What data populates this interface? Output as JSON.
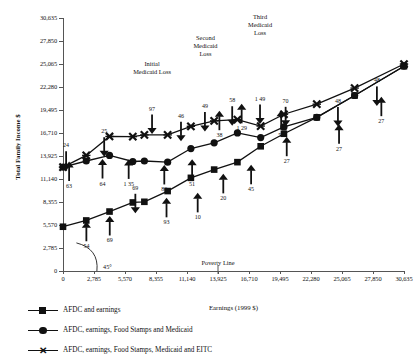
{
  "chart_data": {
    "type": "line",
    "title": "",
    "xlabel": "Earnings (1999 $)",
    "ylabel": "Total Family Income $",
    "xlim": [
      0,
      30635
    ],
    "ylim": [
      0,
      30635
    ],
    "grid": false,
    "legend_position": "below-plot",
    "xticks": [
      "0",
      "2,785",
      "5,570",
      "8,355",
      "11,140",
      "13,925",
      "16,710",
      "19,495",
      "22,280",
      "25,065",
      "27,850",
      "30,635"
    ],
    "yticks": [
      "0",
      "2,785",
      "5,570",
      "8,355",
      "11,140",
      "13,925",
      "16,710",
      "19,495",
      "22,280",
      "25,065",
      "27,850",
      "30,635"
    ],
    "xtick_values": [
      0,
      2785,
      5570,
      8355,
      11140,
      13925,
      16710,
      19495,
      22280,
      25065,
      27850,
      30635
    ],
    "ytick_values": [
      0,
      2785,
      5570,
      8355,
      11140,
      13925,
      16710,
      19495,
      22280,
      25065,
      27850,
      30635
    ],
    "series": [
      {
        "name": "AFDC and earnings",
        "marker": "square",
        "x": [
          0,
          2090,
          4180,
          6270,
          7310,
          9400,
          11490,
          13580,
          15670,
          17760,
          19850,
          22800,
          26200,
          30635
        ],
        "values": [
          5360,
          6120,
          7200,
          8300,
          8380,
          9680,
          11280,
          12280,
          13180,
          15100,
          16620,
          18600,
          21250,
          24800
        ]
      },
      {
        "name": "AFDC, earnings, Food Stamps and Medicaid",
        "marker": "circle",
        "x": [
          0,
          2090,
          4180,
          6270,
          7310,
          9400,
          11490,
          13580,
          15670,
          17760,
          19850,
          22800,
          26200,
          30635
        ],
        "values": [
          12580,
          13320,
          13990,
          13260,
          13320,
          13180,
          14830,
          15520,
          16720,
          16150,
          17450,
          18600,
          21250,
          24800
        ]
      },
      {
        "name": "AFDC, earnings, Food Stamps, Medicaid and EITC",
        "marker": "x",
        "x": [
          0,
          2090,
          4180,
          6270,
          7310,
          9400,
          11490,
          13580,
          15670,
          17760,
          19850,
          22800,
          26200,
          30635
        ],
        "values": [
          12580,
          14000,
          16290,
          16270,
          16480,
          16480,
          17520,
          18180,
          18340,
          17550,
          18980,
          20200,
          22150,
          25060
        ]
      }
    ],
    "annotations": [
      {
        "text": "24",
        "arrow": "down",
        "x": 280,
        "y": 14500
      },
      {
        "text": "25",
        "arrow": "down",
        "x": 3700,
        "y": 16200
      },
      {
        "text": "97",
        "arrow": "down",
        "x": 8000,
        "y": 18950
      },
      {
        "text": "46",
        "arrow": "down",
        "x": 10600,
        "y": 18080
      },
      {
        "text": "49",
        "arrow": "down",
        "x": 12750,
        "y": 19250
      },
      {
        "text": "58",
        "arrow": "down",
        "x": 15200,
        "y": 19950
      },
      {
        "text": "1 49",
        "arrow": "down",
        "x": 17700,
        "y": 20150
      },
      {
        "text": "70",
        "arrow": "down",
        "x": 20000,
        "y": 19880
      },
      {
        "text": "48",
        "arrow": "down",
        "x": 24700,
        "y": 19850
      },
      {
        "text": "48",
        "arrow": "down",
        "x": 28200,
        "y": 22350
      },
      {
        "text": "63",
        "arrow": "up",
        "x": 550,
        "y": 10900
      },
      {
        "text": "64",
        "arrow": "up",
        "x": 3550,
        "y": 11200
      },
      {
        "text": "1 35",
        "arrow": "up",
        "x": 5900,
        "y": 11150
      },
      {
        "text": "86",
        "arrow": "up",
        "x": 9100,
        "y": 10480
      },
      {
        "text": "51",
        "arrow": "up",
        "x": 11600,
        "y": 11180
      },
      {
        "text": "38",
        "arrow": "up",
        "x": 14050,
        "y": 17050
      },
      {
        "text": "1 29",
        "arrow": "up",
        "x": 16050,
        "y": 17880
      },
      {
        "text": "50",
        "arrow": "up",
        "x": 19600,
        "y": 17100
      },
      {
        "text": "27",
        "arrow": "up",
        "x": 20100,
        "y": 13900
      },
      {
        "text": "27",
        "arrow": "up",
        "x": 24800,
        "y": 15400
      },
      {
        "text": "27",
        "arrow": "up",
        "x": 28600,
        "y": 18750
      },
      {
        "text": "54",
        "arrow": "up",
        "x": 2100,
        "y": 3600
      },
      {
        "text": "69",
        "arrow": "up",
        "x": 4200,
        "y": 4300
      },
      {
        "text": "69",
        "arrow": "down",
        "x": 6500,
        "y": 9350
      },
      {
        "text": "93",
        "arrow": "up",
        "x": 9300,
        "y": 6500
      },
      {
        "text": "10",
        "arrow": "up",
        "x": 12100,
        "y": 7100
      },
      {
        "text": "20",
        "arrow": "up",
        "x": 14400,
        "y": 9400
      },
      {
        "text": "45",
        "arrow": "up",
        "x": 16900,
        "y": 10500
      }
    ],
    "callouts": [
      {
        "label": "Initial\nMedicaid Loss",
        "x": 8000,
        "y": 23600
      },
      {
        "label": "Second\nMedicaid\nLoss",
        "x": 12800,
        "y": 25850
      },
      {
        "label": "Third\nMedicaid\nLoss",
        "x": 17700,
        "y": 28300
      }
    ],
    "markers": [
      {
        "text": "Poverty Line",
        "x": 13925,
        "y": 1350
      },
      {
        "text": "45°",
        "x": 3600,
        "y": 900
      }
    ]
  },
  "legend": {
    "items": [
      {
        "marker": "square",
        "label": "AFDC and earnings"
      },
      {
        "marker": "circle",
        "label": "AFDC, earnings, Food Stamps and Medicaid"
      },
      {
        "marker": "x",
        "label": "AFDC, earnings, Food Stamps, Medicaid and EITC"
      }
    ]
  },
  "axis": {
    "ylabel": "Total Family Income $",
    "xlabel": "Earnings (1999 $)"
  },
  "colors": {
    "ink": "#111111",
    "axis": "#555555",
    "background": "#ffffff"
  }
}
